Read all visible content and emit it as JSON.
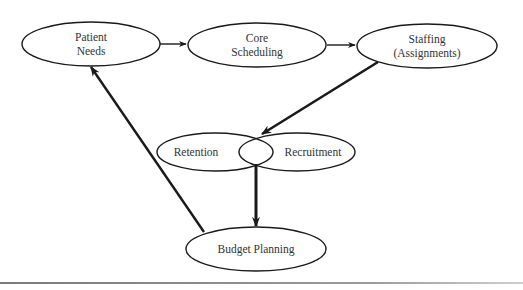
{
  "diagram": {
    "type": "cycle flow diagram",
    "nodes": [
      {
        "id": "patient_needs",
        "lines": [
          "Patient",
          "Needs"
        ]
      },
      {
        "id": "core_scheduling",
        "lines": [
          "Core",
          "Scheduling"
        ]
      },
      {
        "id": "staffing",
        "lines": [
          "Staffing",
          "(Assignments)"
        ]
      },
      {
        "id": "retention",
        "lines": [
          "Retention"
        ]
      },
      {
        "id": "recruitment",
        "lines": [
          "Recruitment"
        ]
      },
      {
        "id": "budget_planning",
        "lines": [
          "Budget Planning"
        ]
      }
    ],
    "edges": [
      {
        "from": "patient_needs",
        "to": "core_scheduling",
        "weight": "thin"
      },
      {
        "from": "core_scheduling",
        "to": "staffing",
        "weight": "thin"
      },
      {
        "from": "staffing",
        "to": "retention_recruitment",
        "weight": "thick"
      },
      {
        "from": "retention_recruitment",
        "to": "budget_planning",
        "weight": "thick"
      },
      {
        "from": "budget_planning",
        "to": "patient_needs",
        "weight": "thick"
      }
    ],
    "colors": {
      "stroke": "#1a1a1a",
      "text": "#333333",
      "background": "#ffffff",
      "divider": "#8a8a8a"
    }
  }
}
